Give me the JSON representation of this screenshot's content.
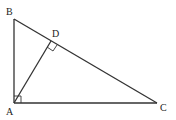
{
  "diagram": {
    "type": "right-triangle-with-altitude",
    "points": {
      "A": {
        "label": "A",
        "x": 14,
        "y": 103
      },
      "B": {
        "label": "B",
        "x": 14,
        "y": 19
      },
      "C": {
        "label": "C",
        "x": 157,
        "y": 103
      },
      "D": {
        "label": "D",
        "x": 51,
        "y": 41
      }
    },
    "segments": [
      "AB",
      "BC",
      "CA",
      "AD"
    ],
    "right_angles": [
      "BAC",
      "ADB"
    ],
    "colors": {
      "stroke": "#333333",
      "background": "#ffffff"
    }
  }
}
